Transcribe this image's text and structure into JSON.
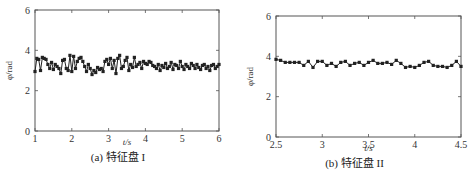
{
  "chart_data": [
    {
      "type": "line",
      "title": "",
      "caption": "(a) 特征盘 I",
      "xlabel": "t/s",
      "ylabel": "φ/rad",
      "xlim": [
        1,
        6
      ],
      "ylim": [
        0,
        6
      ],
      "xticks": [
        1,
        2,
        3,
        4,
        5,
        6
      ],
      "yticks": [
        0,
        2,
        4,
        6
      ],
      "grid": false,
      "marker": "square",
      "series": [
        {
          "name": "phi",
          "x": [
            1.0,
            1.05,
            1.1,
            1.15,
            1.2,
            1.25,
            1.3,
            1.35,
            1.4,
            1.45,
            1.5,
            1.55,
            1.6,
            1.65,
            1.7,
            1.75,
            1.8,
            1.85,
            1.9,
            1.95,
            2.0,
            2.05,
            2.1,
            2.15,
            2.2,
            2.25,
            2.3,
            2.35,
            2.4,
            2.45,
            2.5,
            2.55,
            2.6,
            2.65,
            2.7,
            2.75,
            2.8,
            2.85,
            2.9,
            2.95,
            3.0,
            3.05,
            3.1,
            3.15,
            3.2,
            3.25,
            3.3,
            3.35,
            3.4,
            3.45,
            3.5,
            3.55,
            3.6,
            3.65,
            3.7,
            3.75,
            3.8,
            3.85,
            3.9,
            3.95,
            4.0,
            4.05,
            4.1,
            4.15,
            4.2,
            4.25,
            4.3,
            4.35,
            4.4,
            4.45,
            4.5,
            4.55,
            4.6,
            4.65,
            4.7,
            4.75,
            4.8,
            4.85,
            4.9,
            4.95,
            5.0,
            5.05,
            5.1,
            5.15,
            5.2,
            5.25,
            5.3,
            5.35,
            5.4,
            5.45,
            5.5,
            5.55,
            5.6,
            5.65,
            5.7,
            5.75,
            5.8,
            5.85,
            5.9,
            5.95,
            6.0
          ],
          "values": [
            2.95,
            3.6,
            3.55,
            3.0,
            3.65,
            3.6,
            3.55,
            3.3,
            3.1,
            3.4,
            3.05,
            3.3,
            3.2,
            3.1,
            2.85,
            3.5,
            3.55,
            3.1,
            3.0,
            3.75,
            2.95,
            3.7,
            3.1,
            3.45,
            3.6,
            3.65,
            3.45,
            3.2,
            2.95,
            3.3,
            3.1,
            2.8,
            3.0,
            2.9,
            3.15,
            3.05,
            3.1,
            2.95,
            3.45,
            3.55,
            3.3,
            3.6,
            3.1,
            3.5,
            2.85,
            3.6,
            3.75,
            3.1,
            3.2,
            3.5,
            3.65,
            3.0,
            3.3,
            3.15,
            3.65,
            3.2,
            3.3,
            3.4,
            3.1,
            3.45,
            3.35,
            3.3,
            3.45,
            3.4,
            3.25,
            3.2,
            3.1,
            3.3,
            3.0,
            3.25,
            3.15,
            3.35,
            3.1,
            3.2,
            3.4,
            3.05,
            3.3,
            3.25,
            3.1,
            3.45,
            3.2,
            3.05,
            3.3,
            3.2,
            3.1,
            3.35,
            3.25,
            3.1,
            3.3,
            3.15,
            3.05,
            3.25,
            3.3,
            3.1,
            3.2,
            3.0,
            3.25,
            3.3,
            3.1,
            3.2,
            3.3
          ]
        }
      ]
    },
    {
      "type": "line",
      "title": "",
      "caption": "(b) 特征盘 II",
      "xlabel": "t/s",
      "ylabel": "φ/rad",
      "xlim": [
        2.5,
        4.5
      ],
      "ylim": [
        0,
        6
      ],
      "xticks": [
        2.5,
        3,
        3.5,
        4,
        4.5
      ],
      "yticks": [
        0,
        2,
        4,
        6
      ],
      "grid": false,
      "marker": "square",
      "series": [
        {
          "name": "phi",
          "x": [
            2.5,
            2.55,
            2.6,
            2.65,
            2.7,
            2.75,
            2.8,
            2.85,
            2.9,
            2.95,
            3.0,
            3.05,
            3.1,
            3.15,
            3.2,
            3.25,
            3.3,
            3.35,
            3.4,
            3.45,
            3.5,
            3.55,
            3.6,
            3.65,
            3.7,
            3.75,
            3.8,
            3.85,
            3.9,
            3.95,
            4.0,
            4.05,
            4.1,
            4.15,
            4.2,
            4.25,
            4.3,
            4.35,
            4.4,
            4.45,
            4.5
          ],
          "values": [
            3.85,
            3.8,
            3.7,
            3.7,
            3.7,
            3.7,
            3.55,
            3.75,
            3.45,
            3.75,
            3.75,
            3.55,
            3.65,
            3.5,
            3.7,
            3.75,
            3.55,
            3.65,
            3.7,
            3.55,
            3.7,
            3.8,
            3.65,
            3.65,
            3.7,
            3.6,
            3.8,
            3.65,
            3.45,
            3.5,
            3.45,
            3.55,
            3.7,
            3.75,
            3.55,
            3.5,
            3.5,
            3.45,
            3.55,
            3.75,
            3.5
          ]
        }
      ]
    }
  ]
}
